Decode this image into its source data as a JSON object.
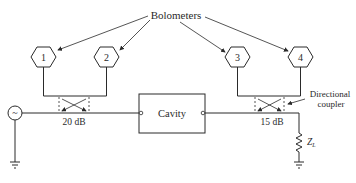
{
  "diagram": {
    "title_label": "Bolometers",
    "bolometers": [
      {
        "id": "1",
        "label": "1"
      },
      {
        "id": "2",
        "label": "2"
      },
      {
        "id": "3",
        "label": "3"
      },
      {
        "id": "4",
        "label": "4"
      }
    ],
    "cavity_label": "Cavity",
    "coupler_left_label": "20 dB",
    "coupler_right_label": "15 dB",
    "directional_coupler_label_line1": "Directional",
    "directional_coupler_label_line2": "coupler",
    "load_label": "Z",
    "load_subscript": "L",
    "source_symbol": "~",
    "colors": {
      "stroke": "#2a2a2a",
      "background": "#ffffff"
    }
  }
}
